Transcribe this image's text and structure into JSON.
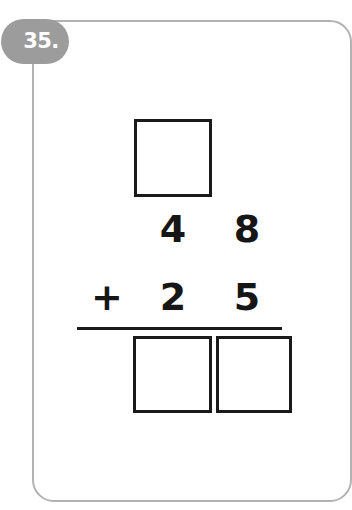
{
  "worksheet": {
    "problem_number": "35.",
    "problem_type": "vertical-addition-with-regrouping",
    "carry_box": {
      "label": "carry-box-tens",
      "value": ""
    },
    "addend_1": {
      "tens": "4",
      "ones": "8"
    },
    "addend_2": {
      "operator": "+",
      "tens": "2",
      "ones": "5"
    },
    "answer": {
      "tens": "",
      "ones": ""
    },
    "colors": {
      "card_border": "#b2b2b2",
      "badge_background": "#9c9c9c",
      "badge_text": "#ffffff",
      "digit": "#161616",
      "box_border": "#1a1a1a",
      "page_background": "#ffffff"
    }
  }
}
